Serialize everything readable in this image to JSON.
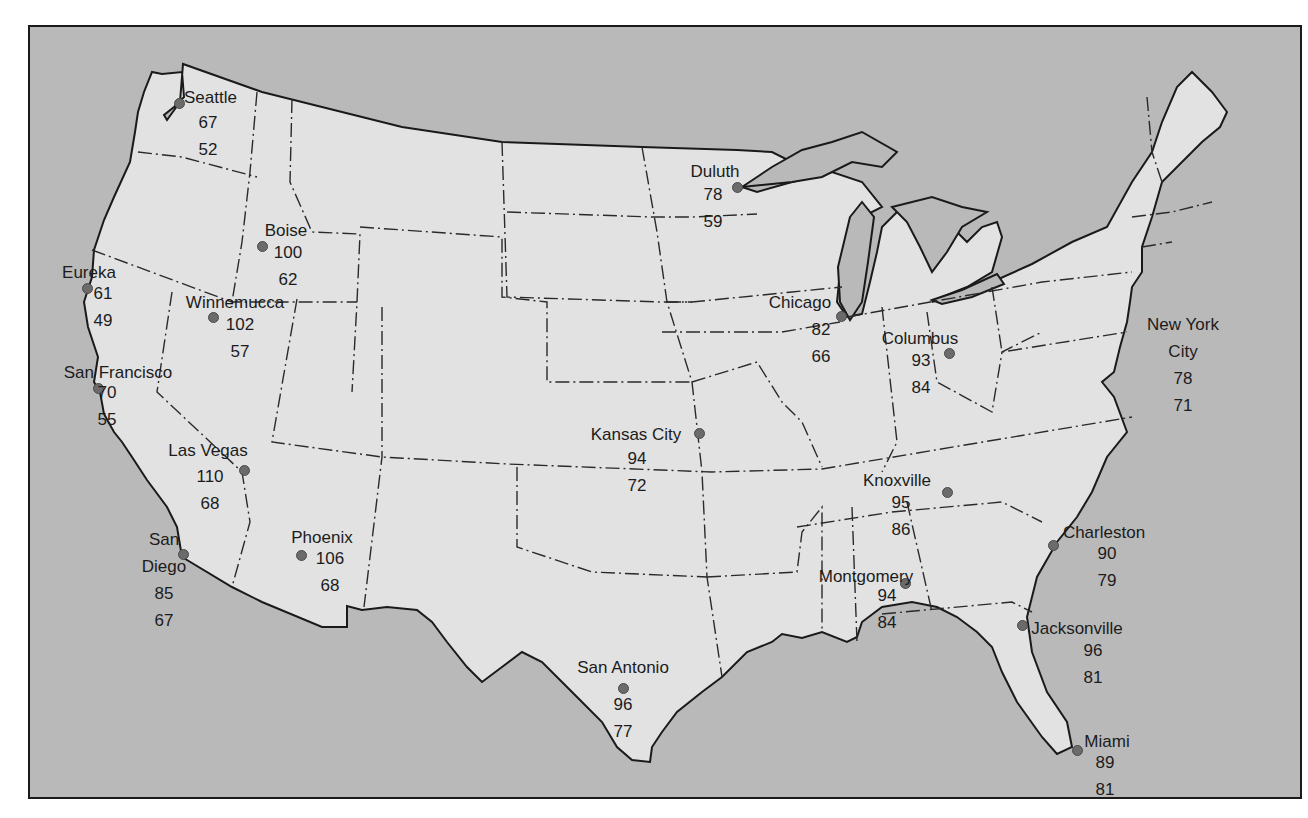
{
  "map": {
    "description": "Contiguous United States with selected city temperatures (upper value / lower value)",
    "colors": {
      "land": "#e2e2e2",
      "water": "#b9b9b9",
      "border": "#1a1a1a",
      "dot": "#6b6b6b"
    },
    "cities": [
      {
        "name": "Seattle",
        "high": "67",
        "low": "52"
      },
      {
        "name": "Boise",
        "high": "100",
        "low": "62"
      },
      {
        "name": "Eureka",
        "high": "61",
        "low": "49"
      },
      {
        "name": "Winnemucca",
        "high": "102",
        "low": "57"
      },
      {
        "name": "San Francisco",
        "high": "70",
        "low": "55"
      },
      {
        "name": "Las Vegas",
        "high": "110",
        "low": "68"
      },
      {
        "name": "San Diego",
        "name_line1": "San",
        "name_line2": "Diego",
        "high": "85",
        "low": "67"
      },
      {
        "name": "Phoenix",
        "high": "106",
        "low": "68"
      },
      {
        "name": "Duluth",
        "high": "78",
        "low": "59"
      },
      {
        "name": "Chicago",
        "high": "82",
        "low": "66"
      },
      {
        "name": "Columbus",
        "high": "93",
        "low": "84"
      },
      {
        "name": "Kansas City",
        "high": "94",
        "low": "72"
      },
      {
        "name": "Knoxville",
        "high": "95",
        "low": "86"
      },
      {
        "name": "New York City",
        "name_line1": "New York",
        "name_line2": "City",
        "high": "78",
        "low": "71"
      },
      {
        "name": "Charleston",
        "high": "90",
        "low": "79"
      },
      {
        "name": "Montgomery",
        "high": "94",
        "low": "84"
      },
      {
        "name": "Jacksonville",
        "high": "96",
        "low": "81"
      },
      {
        "name": "San Antonio",
        "high": "96",
        "low": "77"
      },
      {
        "name": "Miami",
        "high": "89",
        "low": "81"
      }
    ]
  }
}
